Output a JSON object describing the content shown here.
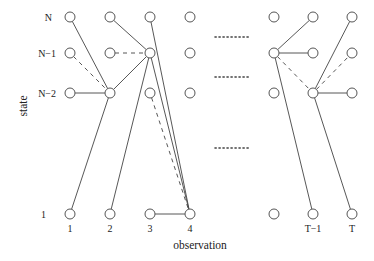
{
  "axes": {
    "y_label": "state",
    "x_label": "observation"
  },
  "state_labels": {
    "N": "N",
    "N_minus_1": "N−1",
    "N_minus_2": "N−2",
    "one": "1"
  },
  "observation_labels": {
    "c1": "1",
    "c2": "2",
    "c3": "3",
    "c4": "4",
    "cT_minus_1": "T−1",
    "cT": "T"
  },
  "diagram": {
    "columns_x": [
      70,
      110,
      150,
      190,
      274,
      313,
      352
    ],
    "rows_y": [
      17,
      53,
      93,
      214
    ],
    "node_radius": 5,
    "edges": [
      {
        "from": [
          0,
          0
        ],
        "to": [
          1,
          2
        ],
        "style": "solid"
      },
      {
        "from": [
          0,
          1
        ],
        "to": [
          1,
          2
        ],
        "style": "dashed"
      },
      {
        "from": [
          0,
          2
        ],
        "to": [
          1,
          2
        ],
        "style": "solid"
      },
      {
        "from": [
          0,
          3
        ],
        "to": [
          1,
          2
        ],
        "style": "solid"
      },
      {
        "from": [
          1,
          0
        ],
        "to": [
          2,
          1
        ],
        "style": "solid"
      },
      {
        "from": [
          1,
          1
        ],
        "to": [
          2,
          1
        ],
        "style": "dashed"
      },
      {
        "from": [
          1,
          2
        ],
        "to": [
          2,
          1
        ],
        "style": "solid"
      },
      {
        "from": [
          1,
          3
        ],
        "to": [
          2,
          1
        ],
        "style": "solid"
      },
      {
        "from": [
          2,
          0
        ],
        "to": [
          3,
          3
        ],
        "style": "solid"
      },
      {
        "from": [
          2,
          1
        ],
        "to": [
          3,
          3
        ],
        "style": "solid"
      },
      {
        "from": [
          2,
          2
        ],
        "to": [
          3,
          3
        ],
        "style": "dashed"
      },
      {
        "from": [
          2,
          3
        ],
        "to": [
          3,
          3
        ],
        "style": "solid"
      },
      {
        "from": [
          4,
          1
        ],
        "to": [
          5,
          0
        ],
        "style": "solid"
      },
      {
        "from": [
          4,
          1
        ],
        "to": [
          5,
          1
        ],
        "style": "solid"
      },
      {
        "from": [
          4,
          1
        ],
        "to": [
          5,
          2
        ],
        "style": "dashed"
      },
      {
        "from": [
          4,
          1
        ],
        "to": [
          5,
          3
        ],
        "style": "solid"
      },
      {
        "from": [
          5,
          2
        ],
        "to": [
          6,
          0
        ],
        "style": "solid"
      },
      {
        "from": [
          5,
          2
        ],
        "to": [
          6,
          1
        ],
        "style": "dashed"
      },
      {
        "from": [
          5,
          2
        ],
        "to": [
          6,
          2
        ],
        "style": "solid"
      },
      {
        "from": [
          5,
          2
        ],
        "to": [
          6,
          3
        ],
        "style": "solid"
      }
    ],
    "ellipsis_rows_y": [
      37,
      77,
      148
    ],
    "ellipsis_x_range": [
      215,
      251
    ]
  }
}
